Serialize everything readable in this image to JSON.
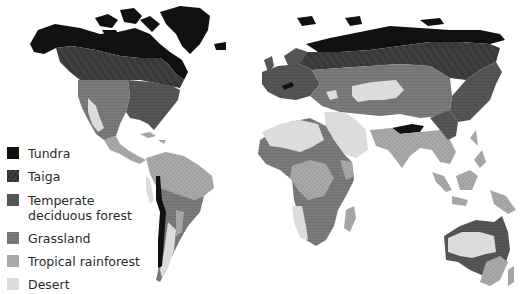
{
  "legend": {
    "items": [
      {
        "key": "tundra",
        "label": "Tundra",
        "color": "#111111",
        "pattern": "solid"
      },
      {
        "key": "taiga",
        "label": "Taiga",
        "color": "#3e3e3e",
        "pattern": "diagonal-hatch"
      },
      {
        "key": "temperate",
        "label": "Temperate\ndeciduous forest",
        "color": "#555555",
        "pattern": "fine-horizontal"
      },
      {
        "key": "grassland",
        "label": "Grassland",
        "color": "#7a7a7a",
        "pattern": "horizontal-lines"
      },
      {
        "key": "tropical",
        "label": "Tropical rainforest",
        "color": "#a9a9a9",
        "pattern": "dotted"
      },
      {
        "key": "desert",
        "label": "Desert",
        "color": "#dcdcdc",
        "pattern": "solid"
      }
    ]
  },
  "regions": [
    "North America",
    "Greenland",
    "South America",
    "Europe",
    "Asia",
    "Africa",
    "Australia",
    "Southeast Asia islands",
    "Madagascar"
  ]
}
